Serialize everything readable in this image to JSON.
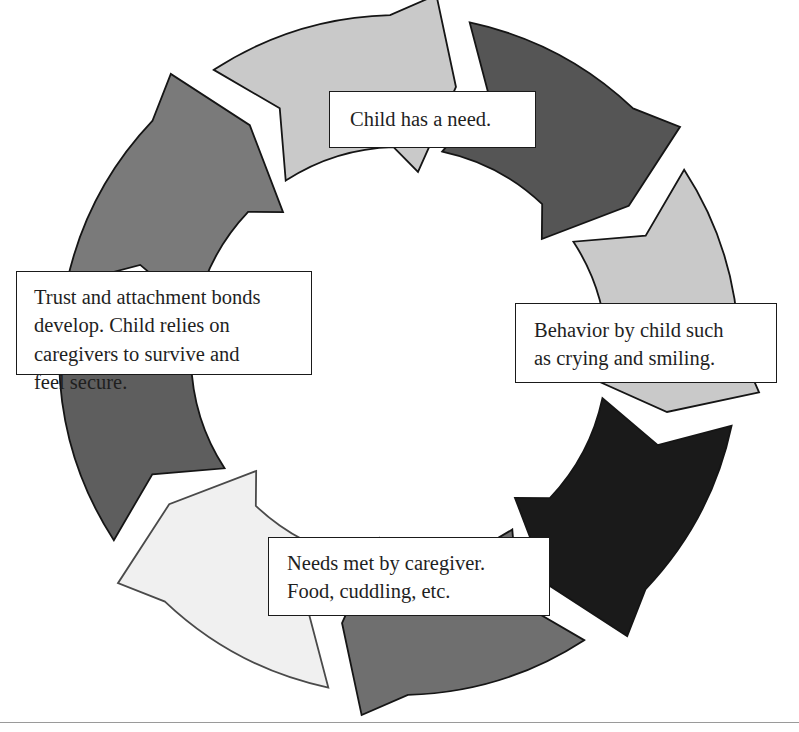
{
  "diagram": {
    "type": "circular-cycle",
    "shape": "ring of eight curved chevron arrows, clockwise",
    "background_color": "#ffffff",
    "center": {
      "x": 399,
      "y": 355
    },
    "outer_radius": 340,
    "inner_radius": 208,
    "labels": [
      {
        "id": "need",
        "text": "Child has a need.",
        "position": "top",
        "border_color": "#1a1a1a",
        "background_color": "#ffffff"
      },
      {
        "id": "behavior",
        "text": "Behavior by child such\nas crying and smiling.",
        "position": "right",
        "border_color": "#1a1a1a",
        "background_color": "#ffffff"
      },
      {
        "id": "needs_met",
        "text": "Needs met by caregiver.\nFood, cuddling, etc.",
        "position": "bottom",
        "border_color": "#1a1a1a",
        "background_color": "#ffffff"
      },
      {
        "id": "trust",
        "text": "Trust and attachment bonds\ndevelop.  Child relies on\ncaregivers to survive and\nfeel secure.",
        "position": "left",
        "border_color": "#1a1a1a",
        "background_color": "#ffffff"
      }
    ],
    "arrows": [
      {
        "index": 0,
        "name": "arrow-top-right",
        "start_deg": -78,
        "end_deg": -33,
        "fill": "#555555",
        "stroke": "#151515"
      },
      {
        "index": 1,
        "name": "arrow-right-upper",
        "start_deg": -33,
        "end_deg": 12,
        "fill": "#c9c9c9",
        "stroke": "#151515"
      },
      {
        "index": 2,
        "name": "arrow-right-lower",
        "start_deg": 12,
        "end_deg": 57,
        "fill": "#1a1a1a",
        "stroke": "#151515"
      },
      {
        "index": 3,
        "name": "arrow-bottom-right",
        "start_deg": 57,
        "end_deg": 102,
        "fill": "#6f6f6f",
        "stroke": "#151515"
      },
      {
        "index": 4,
        "name": "arrow-bottom-left",
        "start_deg": 102,
        "end_deg": 147,
        "fill": "#f0f0f0",
        "stroke": "#4a4a4a"
      },
      {
        "index": 5,
        "name": "arrow-left-lower",
        "start_deg": 147,
        "end_deg": 192,
        "fill": "#5e5e5e",
        "stroke": "#151515"
      },
      {
        "index": 6,
        "name": "arrow-left-upper",
        "start_deg": 192,
        "end_deg": 237,
        "fill": "#7a7a7a",
        "stroke": "#151515"
      },
      {
        "index": 7,
        "name": "arrow-top-left",
        "start_deg": 237,
        "end_deg": 282,
        "fill": "#c9c9c9",
        "stroke": "#151515"
      }
    ],
    "rule": {
      "name": "bottom-divider",
      "color": "#9a9a9a"
    }
  }
}
